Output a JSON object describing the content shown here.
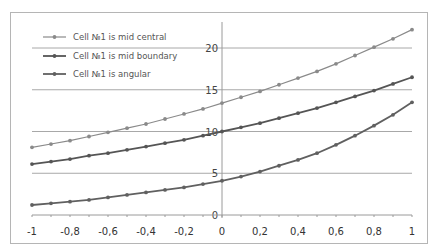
{
  "chart_data": {
    "type": "line",
    "title": "",
    "xlabel": "",
    "ylabel": "",
    "xlim": [
      -1,
      1
    ],
    "ylim": [
      0,
      23
    ],
    "grid": {
      "horizontal": true,
      "vertical": false
    },
    "legend_position": "top-left (inside plot)",
    "x": [
      -1,
      -0.9,
      -0.8,
      -0.7,
      -0.6,
      -0.5,
      -0.4,
      -0.3,
      -0.2,
      -0.1,
      0,
      0.1,
      0.2,
      0.3,
      0.4,
      0.5,
      0.6,
      0.7,
      0.8,
      0.9,
      1
    ],
    "x_tick_labels": [
      "-1",
      "-0,8",
      "-0,6",
      "-0,4",
      "-0,2",
      "0",
      "0,2",
      "0,4",
      "0,6",
      "0,8",
      "1"
    ],
    "x_ticks": [
      -1,
      -0.8,
      -0.6,
      -0.4,
      -0.2,
      0,
      0.2,
      0.4,
      0.6,
      0.8,
      1
    ],
    "y_tick_labels": [
      "0",
      "5",
      "10",
      "15",
      "20"
    ],
    "y_ticks": [
      0,
      5,
      10,
      15,
      20
    ],
    "series": [
      {
        "name": "Cell №1 is mid central",
        "color": "#8a8a8a",
        "values": [
          8.1,
          8.5,
          8.9,
          9.4,
          9.9,
          10.4,
          10.9,
          11.5,
          12.1,
          12.7,
          13.4,
          14.1,
          14.8,
          15.6,
          16.4,
          17.2,
          18.1,
          19.1,
          20.1,
          21.1,
          22.2
        ]
      },
      {
        "name": "Cell №1 is mid boundary",
        "color": "#555555",
        "values": [
          6.1,
          6.4,
          6.7,
          7.1,
          7.4,
          7.8,
          8.2,
          8.6,
          9.0,
          9.5,
          10.0,
          10.5,
          11.0,
          11.6,
          12.2,
          12.8,
          13.5,
          14.2,
          14.9,
          15.7,
          16.5
        ]
      },
      {
        "name": "Cell №1 is angular",
        "color": "#606060",
        "values": [
          1.2,
          1.4,
          1.6,
          1.8,
          2.1,
          2.4,
          2.7,
          3.0,
          3.3,
          3.7,
          4.1,
          4.6,
          5.2,
          5.9,
          6.6,
          7.4,
          8.4,
          9.5,
          10.7,
          12.0,
          13.5
        ]
      }
    ]
  }
}
